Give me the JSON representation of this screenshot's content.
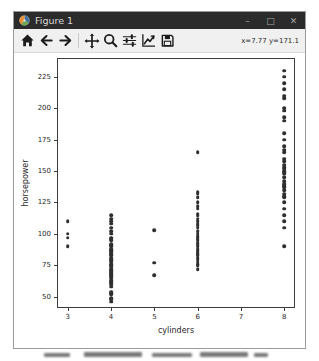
{
  "window": {
    "title": "Figure 1",
    "controls": {
      "minimize": "–",
      "maximize": "□",
      "close": "✕"
    }
  },
  "toolbar": {
    "buttons": [
      "home",
      "back",
      "forward",
      "pan",
      "zoom",
      "configure-subplots",
      "edit-axis",
      "save"
    ],
    "readout": "x=7.77 y=171.1"
  },
  "chart_data": {
    "type": "scatter",
    "title": "",
    "xlabel": "cylinders",
    "ylabel": "horsepower",
    "xticks": [
      3,
      4,
      5,
      6,
      7,
      8
    ],
    "yticks": [
      50,
      75,
      100,
      125,
      150,
      175,
      200,
      225
    ],
    "xlim": [
      2.75,
      8.25
    ],
    "ylim": [
      41,
      240
    ],
    "grid": false,
    "legend": null,
    "marker_color": "#2f2f2f",
    "series": [
      {
        "x": 3,
        "values": [
          90,
          97,
          100,
          110
        ]
      },
      {
        "x": 4,
        "values": [
          46,
          48,
          49,
          52,
          53,
          54,
          58,
          60,
          61,
          62,
          63,
          65,
          66,
          67,
          68,
          69,
          70,
          71,
          72,
          74,
          75,
          76,
          78,
          79,
          80,
          81,
          83,
          84,
          85,
          86,
          87,
          88,
          90,
          91,
          92,
          95,
          96,
          97,
          100,
          102,
          105,
          108,
          110,
          112,
          115
        ]
      },
      {
        "x": 5,
        "values": [
          67,
          77,
          103
        ]
      },
      {
        "x": 6,
        "values": [
          72,
          75,
          76,
          78,
          80,
          81,
          83,
          84,
          85,
          86,
          88,
          90,
          92,
          93,
          95,
          96,
          97,
          98,
          100,
          102,
          105,
          107,
          108,
          110,
          112,
          115,
          116,
          120,
          122,
          125,
          129,
          132,
          133,
          165
        ]
      },
      {
        "x": 8,
        "values": [
          90,
          105,
          110,
          115,
          120,
          125,
          129,
          130,
          132,
          135,
          137,
          138,
          139,
          140,
          142,
          145,
          148,
          149,
          150,
          152,
          153,
          155,
          158,
          160,
          165,
          167,
          170,
          175,
          180,
          190,
          193,
          198,
          200,
          208,
          210,
          215,
          220,
          225,
          230
        ]
      }
    ]
  }
}
